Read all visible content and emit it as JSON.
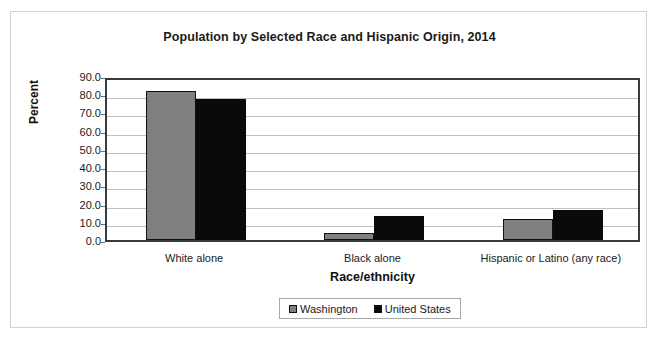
{
  "chart_data": {
    "type": "bar",
    "title": "Population by Selected Race and Hispanic Origin, 2014",
    "xlabel": "Race/ethnicity",
    "ylabel": "Percent",
    "categories": [
      "White alone",
      "Black alone",
      "Hispanic or Latino (any race)"
    ],
    "series": [
      {
        "name": "Washington",
        "color": "#808080",
        "values": [
          81.9,
          3.9,
          11.4
        ]
      },
      {
        "name": "United States",
        "color": "#0a0a0a",
        "values": [
          77.4,
          13.2,
          16.3
        ]
      }
    ],
    "ylim": [
      0.0,
      90.0
    ],
    "ytick_step": 10.0,
    "ytick_labels": [
      "90.0",
      "80.0",
      "70.0",
      "60.0",
      "50.0",
      "40.0",
      "30.0",
      "20.0",
      "10.0",
      "0.0"
    ],
    "grid": true,
    "legend_position": "bottom-center"
  },
  "legend": {
    "entries": [
      {
        "label": "Washington",
        "swatch": "gray-square-icon"
      },
      {
        "label": "United States",
        "swatch": "black-square-icon"
      }
    ]
  }
}
